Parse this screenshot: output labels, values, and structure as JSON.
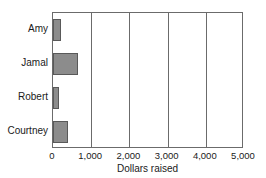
{
  "chart_data": {
    "type": "bar",
    "orientation": "horizontal",
    "title": "",
    "xlabel": "Dollars raised",
    "ylabel": "",
    "categories": [
      "Amy",
      "Jamal",
      "Robert",
      "Courtney"
    ],
    "values": [
      200,
      650,
      150,
      400
    ],
    "xlim": [
      0,
      5000
    ],
    "xticks": [
      0,
      1000,
      2000,
      3000,
      4000,
      5000
    ],
    "xticklabels": [
      "0",
      "1,000",
      "2,000",
      "3,000",
      "4,000",
      "5,000"
    ],
    "grid": true,
    "grid_axis": "x",
    "legend": false,
    "bar_color": "#8c8c8c",
    "bar_edge_color": "#595959",
    "axis_color": "#6b6b6b",
    "plot_background": "#ffffff"
  }
}
